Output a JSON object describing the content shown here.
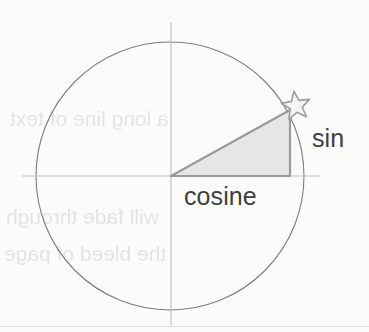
{
  "figure": {
    "background_color": "#fbfbfa",
    "circle": {
      "name": "unit-circle",
      "center_x": 170,
      "center_y": 176,
      "radius": 134,
      "stroke_color": "#7d7d7d",
      "stroke_width": 1.1,
      "fill": "none"
    },
    "axes": {
      "horizontal": {
        "name": "x-axis",
        "x1": 22,
        "y1": 176,
        "x2": 320,
        "y2": 176,
        "stroke_color": "#c3c3c3",
        "stroke_width": 1.2
      },
      "vertical": {
        "name": "y-axis",
        "x1": 171,
        "y1": 22,
        "x2": 171,
        "y2": 325,
        "stroke_color": "#c3c3c3",
        "stroke_width": 1.2
      }
    },
    "triangle": {
      "name": "right-triangle",
      "points": "171,176 290,176 290,110",
      "fill_color": "#e6e6e6",
      "stroke_color": "#9a9a9a",
      "stroke_width": 2.2,
      "origin_x": 171,
      "origin_y": 176,
      "corner_x": 290,
      "corner_y": 176,
      "apex_x": 290,
      "apex_y": 110
    },
    "star_marker": {
      "name": "star-point-marker",
      "center_x": 296,
      "center_y": 106,
      "outer_radius": 15,
      "inner_radius": 6.4,
      "points": 5,
      "rotation_deg": -8,
      "fill_color": "#f4f4f4",
      "stroke_color": "#9d9d9d",
      "stroke_width": 1.6
    },
    "labels": {
      "sin": "sin",
      "cosine": "cosine",
      "text_color": "#3f3f3f",
      "font_size_px": 25
    }
  },
  "page": {
    "bottom_rule_color": "#dcdcdc",
    "ghost_text_lines": [
      "a long line of text",
      "will fade through",
      "the bleed of page"
    ]
  },
  "chart_data": {
    "type": "line",
    "xlabel": "cosine",
    "ylabel": "sin",
    "xlim": [
      -1,
      1
    ],
    "ylim": [
      -1,
      1
    ],
    "grid": false,
    "legend": "none",
    "annotations": [
      "sin",
      "cosine"
    ],
    "series": [
      {
        "name": "unit-circle",
        "kind": "circle",
        "center": [
          0,
          0
        ],
        "radius": 1
      },
      {
        "name": "right-triangle",
        "kind": "polygon",
        "x": [
          0,
          0.888,
          0.888,
          0
        ],
        "y": [
          0,
          0,
          0.493,
          0
        ]
      },
      {
        "name": "point-on-circle",
        "kind": "marker",
        "marker": "star",
        "x": [
          0.888
        ],
        "y": [
          0.493
        ]
      }
    ]
  }
}
